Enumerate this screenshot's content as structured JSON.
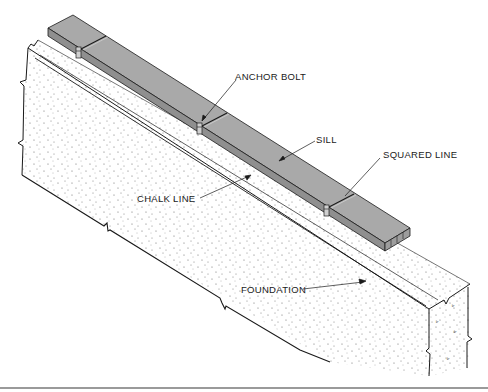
{
  "figure": {
    "type": "isometric technical illustration",
    "colors": {
      "sill_fill": "#a9a9a9",
      "sill_front": "#8f8f8f",
      "foundation_fill": "#ffffff",
      "stipple": "#6a6a6a",
      "line": "#1a1a1a",
      "bottom_rule": "#9a9a9a"
    }
  },
  "labels": {
    "anchor_bolt": "ANCHOR BOLT",
    "sill": "SILL",
    "squared_line": "SQUARED LINE",
    "chalk_line": "CHALK LINE",
    "foundation": "FOUNDATION"
  }
}
